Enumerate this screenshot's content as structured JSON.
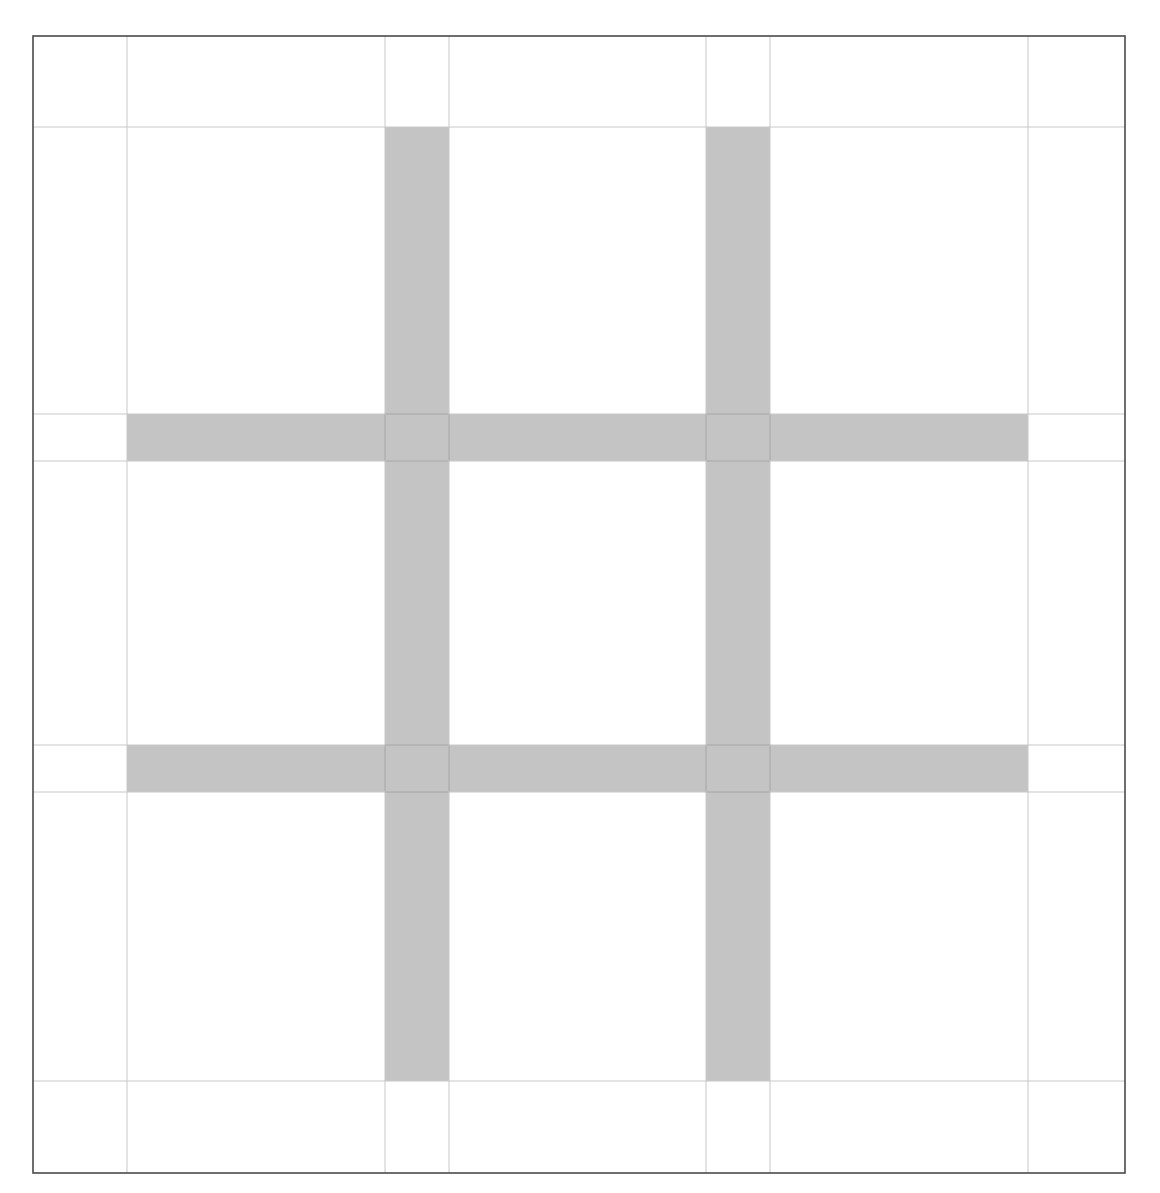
{
  "diagram": {
    "type": "grid-layout",
    "canvas": {
      "width": 1160,
      "height": 1193
    },
    "colors": {
      "background": "#ffffff",
      "frame": "#4a4a4a",
      "guide_line": "#c8c8c8",
      "band_fill": "#c4c4c4",
      "band_overlap_edge": "#8a8a8a"
    },
    "frame": {
      "x1": 33,
      "y1": 36,
      "x2": 1125,
      "y2": 1173
    },
    "guides": {
      "vertical": [
        127,
        385,
        449,
        706,
        770,
        1028
      ],
      "horizontal": [
        127,
        414,
        461,
        745,
        792,
        1081
      ]
    },
    "bands": {
      "vertical": [
        {
          "x1": 385,
          "x2": 449,
          "y1": 127,
          "y2": 1081
        },
        {
          "x1": 706,
          "x2": 770,
          "y1": 127,
          "y2": 1081
        }
      ],
      "horizontal": [
        {
          "y1": 414,
          "y2": 461,
          "x1": 127,
          "x2": 1028
        },
        {
          "y1": 745,
          "y2": 792,
          "x1": 127,
          "x2": 1028
        }
      ]
    },
    "cells": {
      "rows": 3,
      "cols": 3
    }
  }
}
